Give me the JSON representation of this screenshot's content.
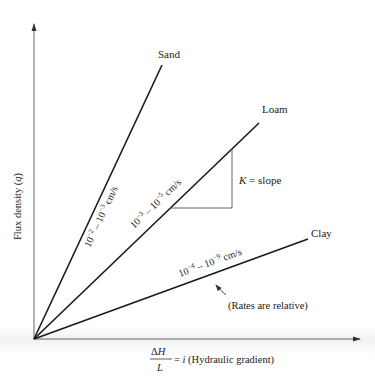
{
  "diagram": {
    "y_axis_label": "Flux density (q)",
    "y_axis_label_parts": {
      "prefix": "Flux density (",
      "var": "q",
      "suffix": ")"
    },
    "x_axis_label": {
      "numerator": "ΔH",
      "numerator_parts": {
        "delta": "Δ",
        "var": "H"
      },
      "denominator": "L",
      "rest_prefix": "= ",
      "rest_var": "i",
      "rest_suffix": " (Hydraulic gradient)"
    },
    "lines": [
      {
        "name": "Sand",
        "rate_base1": "10",
        "rate_exp1": "−2",
        "rate_mid": " – 10",
        "rate_exp2": "−3",
        "rate_unit": " cm/s",
        "rate": "10^-2 – 10^-3 cm/s"
      },
      {
        "name": "Loam",
        "rate_base1": "10",
        "rate_exp1": "−3",
        "rate_mid": " – 10",
        "rate_exp2": "−5",
        "rate_unit": " cm/s",
        "rate": "10^-3 – 10^-5 cm/s"
      },
      {
        "name": "Clay",
        "rate_base1": "10",
        "rate_exp1": "−4",
        "rate_mid": " – 10",
        "rate_exp2": "−9",
        "rate_unit": " cm/s",
        "rate": "10^-4 – 10^-9 cm/s"
      }
    ],
    "slope_label": {
      "var": "K",
      "rest": " = slope"
    },
    "note": "(Rates are relative)",
    "colors": {
      "line": "#1a1a1a",
      "axis": "#555555",
      "text": "#222222"
    }
  }
}
